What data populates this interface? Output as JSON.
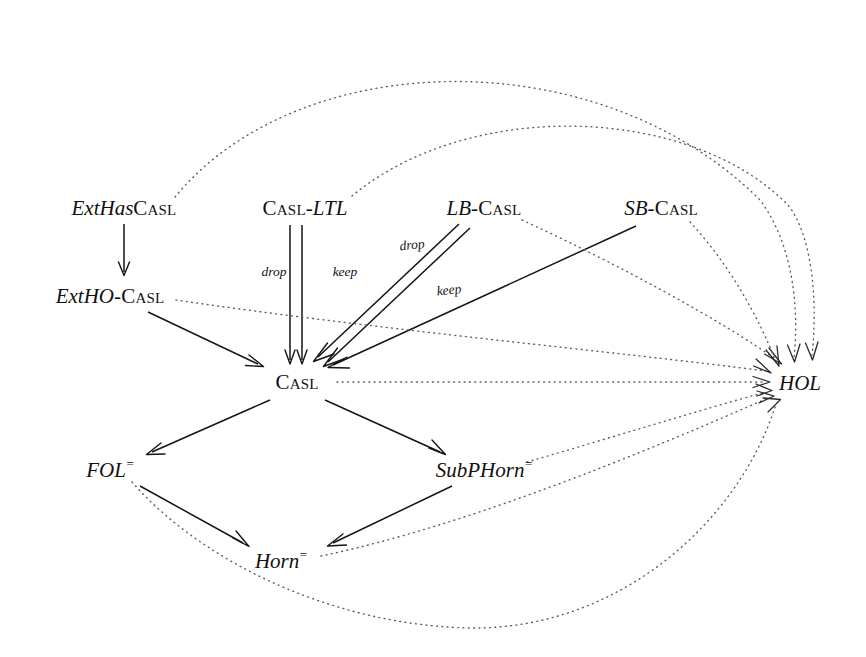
{
  "figure": {
    "background_color": "#ffffff",
    "solid_edge_color": "#141414",
    "dotted_edge_color": "#5f5f5f",
    "text_color": "#111111",
    "width": 866,
    "height": 657
  },
  "nodes": {
    "ext_has_casl": {
      "prefix": "ExtHas",
      "suffix": "Casl",
      "x": 124,
      "y": 208
    },
    "casl_ltl": {
      "prefix": "Casl",
      "suffix": "-LTL",
      "x": 305,
      "y": 208
    },
    "lb_casl": {
      "prefix": "LB",
      "suffix": "-Casl",
      "x": 484,
      "y": 208
    },
    "sb_casl": {
      "prefix": "SB",
      "suffix": "-Casl",
      "x": 661,
      "y": 208
    },
    "ext_ho_casl": {
      "prefix": "ExtHO",
      "suffix": "-Casl",
      "x": 110,
      "y": 296
    },
    "casl": {
      "prefix": "",
      "suffix": "Casl",
      "x": 297,
      "y": 382
    },
    "hol": {
      "prefix": "HOL",
      "suffix": "",
      "x": 800,
      "y": 383
    },
    "fol_eq": {
      "prefix": "FOL",
      "suffix": "=",
      "x": 110,
      "y": 469
    },
    "subphorn_eq": {
      "prefix": "SubPHorn",
      "suffix": "=",
      "x": 484,
      "y": 469
    },
    "horn_eq": {
      "prefix": "Horn",
      "suffix": "=",
      "x": 281,
      "y": 560
    }
  },
  "edge_labels": {
    "ltl_drop": {
      "text": "drop",
      "x": 274,
      "y": 272
    },
    "ltl_keep": {
      "text": "keep",
      "x": 345,
      "y": 272
    },
    "lb_drop": {
      "text": "drop",
      "x": 412,
      "y": 245
    },
    "lb_keep": {
      "text": "keep",
      "x": 449,
      "y": 290
    }
  },
  "edges": [
    {
      "name": "ext-has-casl-to-ext-ho-casl",
      "from": "ext_has_casl",
      "to": "ext_ho_casl",
      "style": "solid",
      "label": ""
    },
    {
      "name": "casl-ltl-drop-to-casl",
      "from": "casl_ltl",
      "to": "casl",
      "style": "solid",
      "label": "drop"
    },
    {
      "name": "casl-ltl-keep-to-casl",
      "from": "casl_ltl",
      "to": "casl",
      "style": "solid",
      "label": "keep"
    },
    {
      "name": "lb-casl-drop-to-casl",
      "from": "lb_casl",
      "to": "casl",
      "style": "solid",
      "label": "drop"
    },
    {
      "name": "lb-casl-keep-to-casl",
      "from": "lb_casl",
      "to": "casl",
      "style": "solid",
      "label": "keep"
    },
    {
      "name": "sb-casl-to-casl",
      "from": "sb_casl",
      "to": "casl",
      "style": "solid",
      "label": ""
    },
    {
      "name": "ext-ho-casl-to-casl",
      "from": "ext_ho_casl",
      "to": "casl",
      "style": "solid",
      "label": ""
    },
    {
      "name": "casl-to-fol-eq",
      "from": "casl",
      "to": "fol_eq",
      "style": "solid",
      "label": ""
    },
    {
      "name": "casl-to-subphorn-eq",
      "from": "casl",
      "to": "subphorn_eq",
      "style": "solid",
      "label": ""
    },
    {
      "name": "fol-eq-to-horn-eq",
      "from": "fol_eq",
      "to": "horn_eq",
      "style": "solid",
      "label": ""
    },
    {
      "name": "subphorn-eq-to-horn-eq",
      "from": "subphorn_eq",
      "to": "horn_eq",
      "style": "solid",
      "label": ""
    },
    {
      "name": "ext-has-casl-to-hol",
      "from": "ext_has_casl",
      "to": "hol",
      "style": "dotted",
      "label": ""
    },
    {
      "name": "casl-ltl-to-hol",
      "from": "casl_ltl",
      "to": "hol",
      "style": "dotted",
      "label": ""
    },
    {
      "name": "lb-casl-to-hol",
      "from": "lb_casl",
      "to": "hol",
      "style": "dotted",
      "label": ""
    },
    {
      "name": "sb-casl-to-hol",
      "from": "sb_casl",
      "to": "hol",
      "style": "dotted",
      "label": ""
    },
    {
      "name": "ext-ho-casl-to-hol",
      "from": "ext_ho_casl",
      "to": "hol",
      "style": "dotted",
      "label": ""
    },
    {
      "name": "casl-to-hol",
      "from": "casl",
      "to": "hol",
      "style": "dotted",
      "label": ""
    },
    {
      "name": "fol-eq-to-hol",
      "from": "fol_eq",
      "to": "hol",
      "style": "dotted",
      "label": ""
    },
    {
      "name": "subphorn-eq-to-hol",
      "from": "subphorn_eq",
      "to": "hol",
      "style": "dotted",
      "label": ""
    },
    {
      "name": "horn-eq-to-hol",
      "from": "horn_eq",
      "to": "hol",
      "style": "dotted",
      "label": ""
    }
  ]
}
